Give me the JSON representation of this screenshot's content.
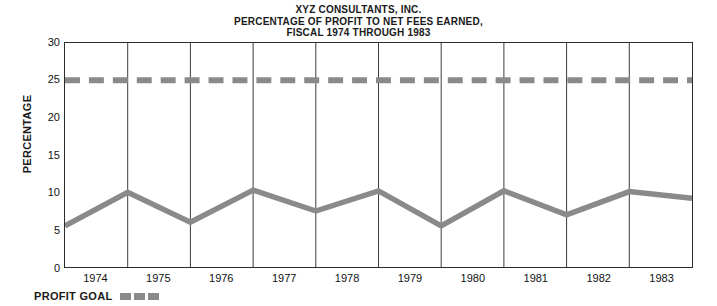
{
  "title": {
    "line1": "XYZ CONSULTANTS, INC.",
    "line2": "PERCENTAGE OF PROFIT TO NET FEES EARNED,",
    "line3": "FISCAL 1974 THROUGH 1983"
  },
  "axis": {
    "ylabel": "PERCENTAGE",
    "yticks": [
      "30",
      "25",
      "20",
      "15",
      "10",
      "5",
      "0"
    ],
    "xticks": [
      "1974",
      "1975",
      "1976",
      "1977",
      "1978",
      "1979",
      "1980",
      "1981",
      "1982",
      "1983"
    ]
  },
  "legend": {
    "profit_goal_label": "PROFIT GOAL"
  },
  "colors": {
    "series_line": "#8a8a8a",
    "goal_line": "#8a8a8a",
    "axis": "#2b2b2b",
    "grid": "#3a3a3a",
    "text": "#111111",
    "background": "#ffffff"
  },
  "chart_data": {
    "type": "line",
    "title": "XYZ CONSULTANTS, INC. PERCENTAGE OF PROFIT TO NET FEES EARNED, FISCAL 1974 THROUGH 1983",
    "xlabel": "",
    "ylabel": "PERCENTAGE",
    "ylim": [
      0,
      30
    ],
    "yticks": [
      0,
      5,
      10,
      15,
      20,
      25,
      30
    ],
    "grid": "vertical-only",
    "legend_position": "below-axis-left",
    "categories": [
      "start",
      "1974",
      "1975",
      "1976",
      "1977",
      "1978",
      "1979",
      "1980",
      "1981",
      "1982",
      "1983"
    ],
    "series": [
      {
        "name": "Percentage of profit to net fees earned",
        "style": "solid",
        "color": "#8a8a8a",
        "values": [
          5.5,
          10.0,
          6.0,
          10.3,
          7.5,
          10.2,
          5.5,
          10.2,
          7.0,
          10.1,
          9.2
        ]
      },
      {
        "name": "PROFIT GOAL",
        "style": "dashed",
        "color": "#8a8a8a",
        "constant": 25,
        "values": [
          25,
          25,
          25,
          25,
          25,
          25,
          25,
          25,
          25,
          25,
          25
        ]
      }
    ]
  }
}
